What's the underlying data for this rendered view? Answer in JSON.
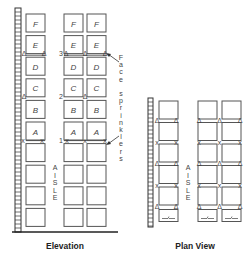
{
  "elevation": {
    "title": "Elevation",
    "row_labels": [
      "F",
      "E",
      "D",
      "C",
      "B",
      "A",
      "",
      "",
      "",
      ""
    ],
    "level_numbers": [
      "3",
      "2",
      "1"
    ],
    "aisle_label": [
      "A",
      "I",
      "S",
      "L",
      "E"
    ],
    "annotation": [
      "F",
      "a",
      "c",
      "e",
      "",
      "s",
      "p",
      "r",
      "i",
      "n",
      "k",
      "l",
      "e",
      "r",
      "s"
    ]
  },
  "plan": {
    "title": "Plan View",
    "aisle_label": [
      "A",
      "I",
      "S",
      "L",
      "E"
    ]
  },
  "symbols": {
    "triangle": "Δ",
    "cross": "x"
  }
}
